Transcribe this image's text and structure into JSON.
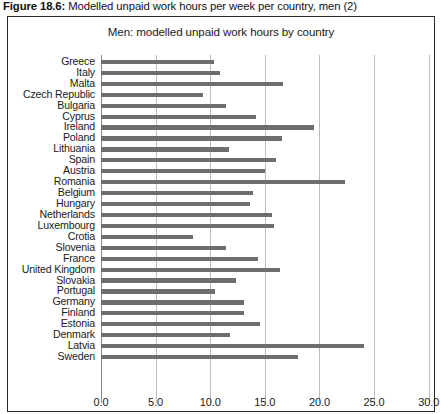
{
  "figure": {
    "caption_label": "Figure 18.6:",
    "caption_text": " Modelled unpaid work hours per week per country, men (2)"
  },
  "chart_data": {
    "type": "bar",
    "orientation": "horizontal",
    "title": "Men: modelled unpaid work hours by country",
    "xlabel": "",
    "ylabel": "",
    "xlim": [
      0.0,
      30.0
    ],
    "xticks": [
      "0.0",
      "5.0",
      "10.0",
      "15.0",
      "20.0",
      "25.0",
      "30.0"
    ],
    "xtick_values": [
      0.0,
      5.0,
      10.0,
      15.0,
      20.0,
      25.0,
      30.0
    ],
    "grid": true,
    "legend": null,
    "bar_color": "#6e6e6e",
    "categories": [
      "Greece",
      "Italy",
      "Malta",
      "Czech Republic",
      "Bulgaria",
      "Cyprus",
      "Ireland",
      "Poland",
      "Lithuania",
      "Spain",
      "Austria",
      "Romania",
      "Belgium",
      "Hungary",
      "Netherlands",
      "Luxembourg",
      "Crotia",
      "Slovenia",
      "France",
      "United Kingdom",
      "Slovakia",
      "Portugal",
      "Germany",
      "Finland",
      "Estonia",
      "Denmark",
      "Latvia",
      "Sweden"
    ],
    "values": [
      10.3,
      10.9,
      16.7,
      9.3,
      11.4,
      14.2,
      19.5,
      16.6,
      11.7,
      16.0,
      15.0,
      22.3,
      13.9,
      13.6,
      15.7,
      15.8,
      8.4,
      11.4,
      14.4,
      16.4,
      12.4,
      10.4,
      13.1,
      13.1,
      14.6,
      11.8,
      24.1,
      18.0
    ]
  }
}
